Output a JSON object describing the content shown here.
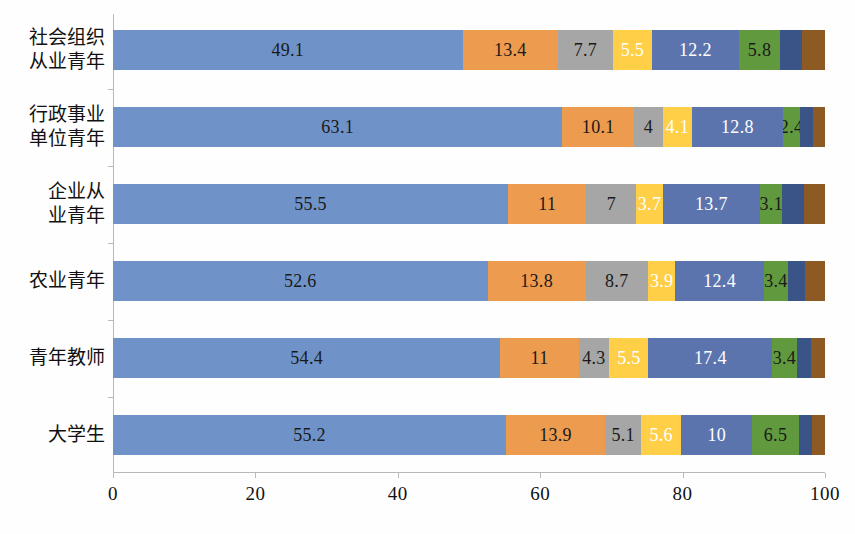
{
  "chart_data": {
    "type": "bar",
    "orientation": "horizontal",
    "stacked": true,
    "title": "",
    "subtitle": "",
    "xlabel": "",
    "ylabel": "",
    "xlim": [
      0,
      100
    ],
    "xticks": [
      0,
      20,
      40,
      60,
      80,
      100
    ],
    "xtick_labels": [
      "0",
      "20",
      "40",
      "60",
      "80",
      "100"
    ],
    "grid": false,
    "legend": "none",
    "categories": [
      "社会组织\n从业青年",
      "行政事业\n单位青年",
      "企业从\n业青年",
      "农业青年",
      "青年教师",
      "大学生"
    ],
    "series": [
      {
        "name": "series-1",
        "color": "#6F93C8",
        "label_color": "#1a1a1a",
        "values": [
          49.1,
          63.1,
          55.5,
          52.6,
          54.4,
          55.2
        ],
        "labels": [
          "49.1",
          "63.1",
          "55.5",
          "52.6",
          "54.4",
          "55.2"
        ]
      },
      {
        "name": "series-2",
        "color": "#ED9B4E",
        "label_color": "#1a1a1a",
        "values": [
          13.4,
          10.1,
          11,
          13.8,
          11,
          13.9
        ],
        "labels": [
          "13.4",
          "10.1",
          "11",
          "13.8",
          "11",
          "13.9"
        ]
      },
      {
        "name": "series-3",
        "color": "#A6A6A6",
        "label_color": "#1a1a1a",
        "values": [
          7.7,
          4,
          7,
          8.7,
          4.3,
          5.1
        ],
        "labels": [
          "7.7",
          "4",
          "7",
          "8.7",
          "4.3",
          "5.1"
        ]
      },
      {
        "name": "series-4",
        "color": "#FFCF48",
        "label_color": "#ffffff",
        "values": [
          5.5,
          4.1,
          3.7,
          3.9,
          5.5,
          5.6
        ],
        "labels": [
          "5.5",
          "4.1",
          "3.7",
          "3.9",
          "5.5",
          "5.6"
        ]
      },
      {
        "name": "series-5",
        "color": "#5B74AD",
        "label_color": "#ffffff",
        "values": [
          12.2,
          12.8,
          13.7,
          12.4,
          17.4,
          10
        ],
        "labels": [
          "12.2",
          "12.8",
          "13.7",
          "12.4",
          "17.4",
          "10"
        ]
      },
      {
        "name": "series-6",
        "color": "#61993E",
        "label_color": "#1a1a1a",
        "values": [
          5.8,
          2.4,
          3.1,
          3.4,
          3.4,
          6.5
        ],
        "labels": [
          "5.8",
          "2.4",
          "3.1",
          "3.4",
          "3.4",
          "6.5"
        ]
      },
      {
        "name": "series-7",
        "color": "#3A5488",
        "label_color": "#ffffff",
        "values": [
          3.1,
          1.8,
          3.0,
          2.4,
          2.1,
          1.9
        ],
        "labels": [
          "",
          "",
          "",
          "",
          "",
          ""
        ]
      },
      {
        "name": "series-8",
        "color": "#8C5A22",
        "label_color": "#ffffff",
        "values": [
          3.2,
          1.7,
          3.0,
          2.8,
          1.9,
          1.8
        ],
        "labels": [
          "",
          "",
          "",
          "",
          "",
          ""
        ]
      }
    ]
  }
}
